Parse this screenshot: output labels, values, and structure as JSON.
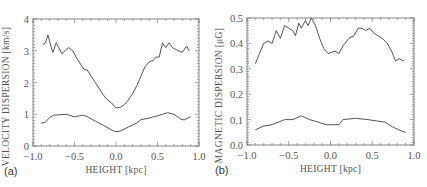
{
  "chart_data": [
    {
      "panel_label": "(a)",
      "type": "line",
      "xlabel": "HEIGHT [kpc]",
      "ylabel": "VELOCITY DISPERSION [km/s]",
      "xlim": [
        -1.0,
        1.0
      ],
      "ylim": [
        0,
        4
      ],
      "xticks": [
        "-1.0",
        "-0.5",
        "0.0",
        "0.5",
        "1.0"
      ],
      "yticks": [
        "0",
        "1",
        "2",
        "3",
        "4"
      ],
      "xtick_values": [
        -1.0,
        -0.5,
        0.0,
        0.5,
        1.0
      ],
      "ytick_values": [
        0,
        1,
        2,
        3,
        4
      ],
      "grid": false,
      "series": [
        {
          "name": "upper",
          "x": [
            -0.88,
            -0.85,
            -0.82,
            -0.78,
            -0.76,
            -0.72,
            -0.69,
            -0.65,
            -0.6,
            -0.57,
            -0.52,
            -0.47,
            -0.42,
            -0.38,
            -0.35,
            -0.3,
            -0.25,
            -0.2,
            -0.15,
            -0.1,
            -0.05,
            -0.02,
            0.0,
            0.05,
            0.1,
            0.15,
            0.2,
            0.25,
            0.3,
            0.35,
            0.4,
            0.45,
            0.48,
            0.52,
            0.56,
            0.6,
            0.64,
            0.68,
            0.75,
            0.8,
            0.85,
            0.88
          ],
          "y": [
            3.2,
            3.25,
            3.5,
            3.1,
            2.95,
            3.25,
            3.1,
            2.9,
            3.05,
            3.1,
            3.0,
            2.75,
            2.55,
            2.4,
            2.4,
            2.2,
            2.0,
            1.8,
            1.6,
            1.45,
            1.35,
            1.25,
            1.2,
            1.22,
            1.3,
            1.45,
            1.65,
            1.9,
            2.2,
            2.5,
            2.65,
            2.7,
            2.8,
            2.8,
            3.25,
            3.1,
            3.25,
            3.1,
            3.0,
            2.95,
            3.15,
            3.0
          ]
        },
        {
          "name": "lower",
          "x": [
            -0.9,
            -0.85,
            -0.8,
            -0.75,
            -0.6,
            -0.5,
            -0.4,
            -0.35,
            -0.25,
            -0.15,
            -0.05,
            0.0,
            0.05,
            0.15,
            0.25,
            0.3,
            0.4,
            0.45,
            0.5,
            0.62,
            0.7,
            0.78,
            0.82,
            0.88,
            0.9
          ],
          "y": [
            0.72,
            0.75,
            0.9,
            0.97,
            1.0,
            0.92,
            0.97,
            0.93,
            0.78,
            0.65,
            0.5,
            0.45,
            0.47,
            0.6,
            0.72,
            0.83,
            0.88,
            0.92,
            0.95,
            1.05,
            1.0,
            0.85,
            0.82,
            0.9,
            0.92
          ]
        }
      ]
    },
    {
      "panel_label": "(b)",
      "type": "line",
      "xlabel": "HEIGHT [kpc]",
      "ylabel": "MAGNETIC DISPERSION [μG]",
      "xlim": [
        -1.0,
        1.0
      ],
      "ylim": [
        0.0,
        0.5
      ],
      "xticks": [
        "-1.0",
        "-0.5",
        "0.0",
        "0.5",
        "1.0"
      ],
      "yticks": [
        "0.0",
        "0.1",
        "0.2",
        "0.3",
        "0.4",
        "0.5"
      ],
      "xtick_values": [
        -1.0,
        -0.5,
        0.0,
        0.5,
        1.0
      ],
      "ytick_values": [
        0.0,
        0.1,
        0.2,
        0.3,
        0.4,
        0.5
      ],
      "grid": false,
      "series": [
        {
          "name": "upper",
          "x": [
            -0.9,
            -0.85,
            -0.8,
            -0.75,
            -0.7,
            -0.65,
            -0.6,
            -0.55,
            -0.5,
            -0.45,
            -0.42,
            -0.38,
            -0.35,
            -0.3,
            -0.27,
            -0.23,
            -0.18,
            -0.13,
            -0.08,
            -0.03,
            0.05,
            0.1,
            0.15,
            0.22,
            0.28,
            0.33,
            0.38,
            0.42,
            0.47,
            0.52,
            0.57,
            0.62,
            0.68,
            0.73,
            0.78,
            0.82,
            0.88
          ],
          "y": [
            0.32,
            0.36,
            0.4,
            0.41,
            0.4,
            0.45,
            0.42,
            0.47,
            0.46,
            0.45,
            0.43,
            0.48,
            0.46,
            0.49,
            0.47,
            0.5,
            0.47,
            0.42,
            0.38,
            0.36,
            0.37,
            0.36,
            0.39,
            0.42,
            0.43,
            0.46,
            0.46,
            0.45,
            0.46,
            0.44,
            0.43,
            0.42,
            0.4,
            0.37,
            0.33,
            0.34,
            0.33
          ]
        },
        {
          "name": "lower",
          "x": [
            -0.9,
            -0.8,
            -0.7,
            -0.55,
            -0.45,
            -0.35,
            -0.25,
            -0.15,
            -0.05,
            0.1,
            0.15,
            0.3,
            0.45,
            0.55,
            0.65,
            0.75,
            0.85,
            0.9
          ],
          "y": [
            0.06,
            0.075,
            0.08,
            0.1,
            0.1,
            0.115,
            0.1,
            0.09,
            0.08,
            0.08,
            0.1,
            0.105,
            0.1,
            0.095,
            0.09,
            0.07,
            0.055,
            0.05
          ]
        }
      ]
    }
  ],
  "layout": {
    "panels": [
      {
        "frame": {
          "left": 33,
          "top": 19,
          "right": 199,
          "bottom": 146
        }
      },
      {
        "frame": {
          "left": 34,
          "top": 18,
          "right": 201,
          "bottom": 145
        }
      }
    ]
  }
}
